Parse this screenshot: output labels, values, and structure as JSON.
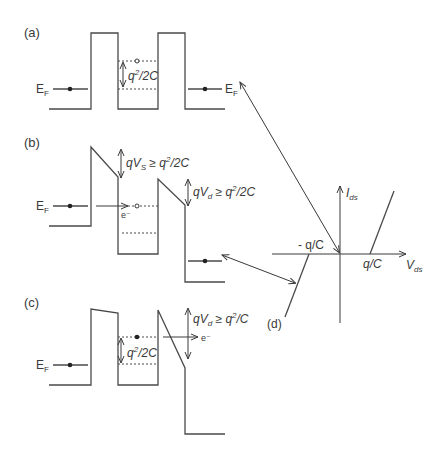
{
  "panels": {
    "a": {
      "label": "(a)",
      "ef_left": "E",
      "ef_sub": "F",
      "ef_right": "E",
      "ef_right_sub": "F",
      "gap_label": "q",
      "gap_sup": "2",
      "gap_rest": "/2C"
    },
    "b": {
      "label": "(b)",
      "ef_left": "E",
      "ef_sub": "F",
      "vs_q": "qV",
      "vs_sub": "S",
      "vs_rest": " ≥ q",
      "vs_sup": "2",
      "vs_tail": "/2C",
      "vd_q": "qV",
      "vd_sub": "d",
      "vd_rest": " ≥ q",
      "vd_sup": "2",
      "vd_tail": "/2C",
      "electron": "e⁻"
    },
    "c": {
      "label": "(c)",
      "ef_left": "E",
      "ef_sub": "F",
      "vd_q": "qV",
      "vd_sub": "d",
      "vd_rest": " ≥ q",
      "vd_sup": "2",
      "vd_tail": "/C",
      "gap_label": "q",
      "gap_sup": "2",
      "gap_rest": "/2C",
      "electron": "e⁻"
    },
    "d": {
      "label": "(d)",
      "y_axis": "I",
      "y_sub": "ds",
      "x_axis": "V",
      "x_sub": "ds",
      "neg_tick": "- q/C",
      "pos_tick": "q/C"
    }
  }
}
